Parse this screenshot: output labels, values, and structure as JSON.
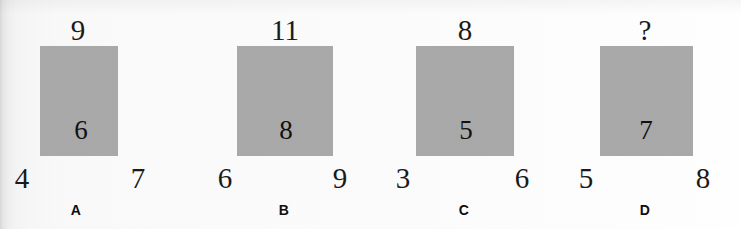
{
  "figure": {
    "kind": "triangle-number-puzzle",
    "background_color": "#fbfbfb",
    "triangle_color": "#a9a9a9",
    "text_color": "#1a1a1a",
    "options": [
      {
        "letter": "A",
        "top": "9",
        "inner": "6",
        "bottom_left": "4",
        "bottom_right": "7"
      },
      {
        "letter": "B",
        "top": "11",
        "inner": "8",
        "bottom_left": "6",
        "bottom_right": "9"
      },
      {
        "letter": "C",
        "top": "8",
        "inner": "5",
        "bottom_left": "3",
        "bottom_right": "6"
      },
      {
        "letter": "D",
        "top": "?",
        "inner": "7",
        "bottom_left": "5",
        "bottom_right": "8"
      }
    ]
  }
}
